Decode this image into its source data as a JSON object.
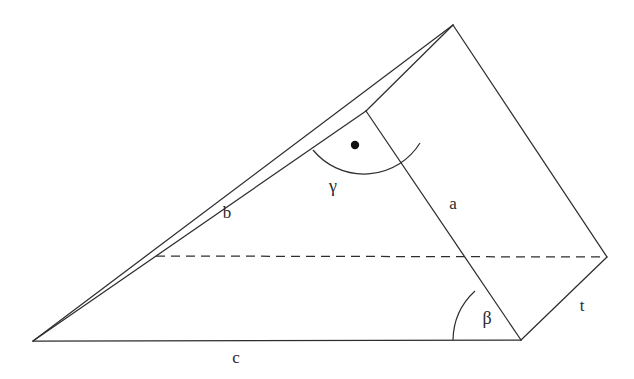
{
  "figure": {
    "type": "geometry-diagram",
    "canvas": {
      "width": 634,
      "height": 379
    },
    "background_color": "#ffffff",
    "stroke_color": "#2e2e32",
    "vertices": {
      "apex_top": [
        453,
        25
      ],
      "bottom_left": [
        33,
        341
      ],
      "bottom_right_front": [
        521,
        340
      ],
      "right_back": [
        607,
        257
      ],
      "a_top_on_b": [
        366,
        111
      ],
      "dashed_left_on_b": [
        156,
        256
      ]
    },
    "edges": [
      {
        "name": "edge-b-upper",
        "from": [
          33,
          341
        ],
        "to": [
          453,
          25
        ],
        "style": "solid"
      },
      {
        "name": "edge-b-lower",
        "from": [
          33,
          341
        ],
        "to": [
          366,
          111
        ],
        "style": "solid"
      },
      {
        "name": "edge-b-lower-extend",
        "from": [
          366,
          111
        ],
        "to": [
          453,
          25
        ],
        "style": "solid"
      },
      {
        "name": "edge-c-base",
        "from": [
          33,
          341
        ],
        "to": [
          521,
          340
        ],
        "style": "solid"
      },
      {
        "name": "edge-a",
        "from": [
          366,
          111
        ],
        "to": [
          521,
          340
        ],
        "style": "solid"
      },
      {
        "name": "edge-apex-to-back",
        "from": [
          453,
          25
        ],
        "to": [
          607,
          257
        ],
        "style": "solid"
      },
      {
        "name": "edge-t",
        "from": [
          521,
          340
        ],
        "to": [
          607,
          257
        ],
        "style": "solid"
      },
      {
        "name": "edge-hidden-dashed",
        "from": [
          156,
          256
        ],
        "to": [
          607,
          257
        ],
        "style": "dashed"
      }
    ],
    "angles": [
      {
        "name": "gamma",
        "symbol": "γ",
        "vertex": [
          366,
          111
        ],
        "radius": 66,
        "label_position": [
          333,
          186
        ]
      },
      {
        "name": "beta",
        "symbol": "β",
        "vertex": [
          521,
          340
        ],
        "radius": 68,
        "label_position": [
          487,
          318
        ]
      }
    ],
    "markers": [
      {
        "name": "interior-dot",
        "position": [
          355,
          145
        ],
        "radius": 4.2,
        "color": "#111114"
      }
    ],
    "labels": [
      {
        "name": "label-a",
        "text": "a",
        "position": [
          453,
          203
        ]
      },
      {
        "name": "label-b",
        "text": "b",
        "position": [
          227,
          212
        ]
      },
      {
        "name": "label-c",
        "text": "c",
        "position": [
          236,
          357
        ]
      },
      {
        "name": "label-t",
        "text": "t",
        "position": [
          582,
          305
        ]
      },
      {
        "name": "label-gamma",
        "text": "γ",
        "position": [
          333,
          186
        ]
      },
      {
        "name": "label-beta",
        "text": "β",
        "position": [
          487,
          318
        ]
      }
    ]
  }
}
